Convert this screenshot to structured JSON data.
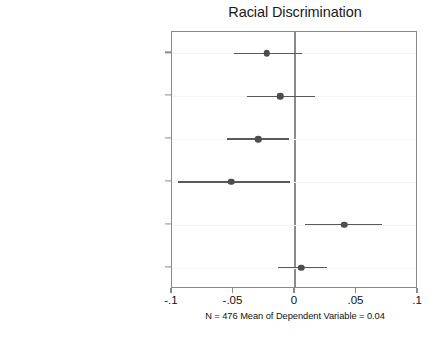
{
  "chart_data": {
    "type": "scatter",
    "title": "Racial Discrimination",
    "subtitle": "N = 476 Mean of Dependent Variable = 0.04",
    "xlabel": "",
    "ylabel": "",
    "xlim": [
      -0.1,
      0.1
    ],
    "xticks": [
      -0.1,
      -0.05,
      0,
      0.05,
      0.1
    ],
    "xticklabels": [
      "-.1",
      "-.05",
      "0",
      ".05",
      ".1"
    ],
    "grid": false,
    "legend": null,
    "reference_line": 0,
    "categories": [
      "Nominee of Color, Same Party",
      "White, Different Party",
      "White, Same Party",
      "Nominee Qualifications",
      "Nominee Judge",
      "Senator Relection Year"
    ],
    "points": [
      {
        "label": "Nominee of Color, Same Party",
        "estimate": -0.023,
        "ci_low": -0.05,
        "ci_high": 0.006
      },
      {
        "label": "White, Different Party",
        "estimate": -0.012,
        "ci_low": -0.039,
        "ci_high": 0.016
      },
      {
        "label": "White, Same Party",
        "estimate": -0.03,
        "ci_low": -0.055,
        "ci_high": -0.005
      },
      {
        "label": "Nominee Qualifications",
        "estimate": -0.052,
        "ci_low": -0.095,
        "ci_high": -0.004
      },
      {
        "label": "Nominee Judge",
        "estimate": 0.04,
        "ci_low": 0.008,
        "ci_high": 0.071
      },
      {
        "label": "Senator Relection Year",
        "estimate": 0.005,
        "ci_low": -0.014,
        "ci_high": 0.026
      }
    ]
  },
  "colors": {
    "marker": "#4d4d4d",
    "whisker": "#5a5a5a",
    "frame": "#8a8a8a",
    "text": "#111111",
    "background": "#ffffff"
  }
}
